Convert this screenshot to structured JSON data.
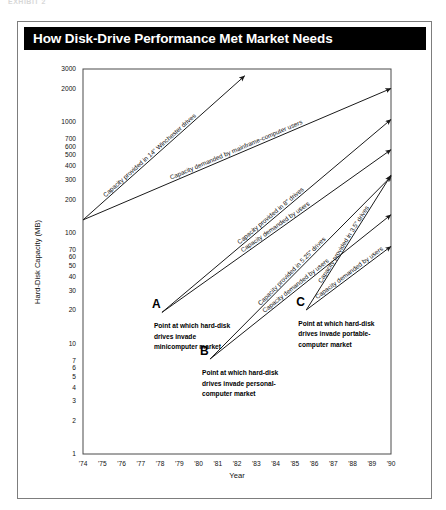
{
  "exhibit": {
    "caption": "EXHIBIT 2"
  },
  "header": {
    "title": "How Disk-Drive Performance Met Market Needs"
  },
  "chart_data": {
    "type": "line",
    "title": "How Disk-Drive Performance Met Market Needs",
    "xlabel": "Year",
    "ylabel": "Hard-Disk Capacity (MB)",
    "yscale": "log",
    "ylim": [
      1,
      3000
    ],
    "xlim": [
      1974,
      1990
    ],
    "grid": false,
    "legend": "inline-labels",
    "ytick_labels": [
      "3000",
      "2000",
      "1000",
      "700",
      "600",
      "500",
      "400",
      "300",
      "200",
      "100",
      "70",
      "60",
      "50",
      "40",
      "30",
      "20",
      "10",
      "7",
      "6",
      "5",
      "4",
      "3",
      "2",
      "1"
    ],
    "ytick_values": [
      3000,
      2000,
      1000,
      700,
      600,
      500,
      400,
      300,
      200,
      100,
      70,
      60,
      50,
      40,
      30,
      20,
      10,
      7,
      6,
      5,
      4,
      3,
      2,
      1
    ],
    "xtick_labels": [
      "'74",
      "'75",
      "'76",
      "'77",
      "'78",
      "'79",
      "'80",
      "'81",
      "'82",
      "'83",
      "'84",
      "'85",
      "'86",
      "'87",
      "'88",
      "'89",
      "'90"
    ],
    "xtick_values": [
      1974,
      1975,
      1976,
      1977,
      1978,
      1979,
      1980,
      1981,
      1982,
      1983,
      1984,
      1985,
      1986,
      1987,
      1988,
      1989,
      1990
    ],
    "series": [
      {
        "name": "Capacity provided in 14\" Winchester drives",
        "label": "Capacity provided in 14\" Winchester drives",
        "x": [
          1974,
          1982.4
        ],
        "y": [
          130,
          2600
        ],
        "arrow": true
      },
      {
        "name": "Capacity demanded by mainframe-computer users",
        "label": "Capacity demanded by mainframe-computer users",
        "x": [
          1974,
          1990
        ],
        "y": [
          130,
          2000
        ],
        "arrow": true
      },
      {
        "name": "Capacity provided in 8\" drives",
        "label": "Capacity provided in 8\" drives",
        "x": [
          1978.1,
          1990
        ],
        "y": [
          19,
          1050
        ],
        "arrow": true
      },
      {
        "name": "Capacity demanded by minicomputer users",
        "label": "Capacity demanded by users",
        "x": [
          1978.1,
          1990
        ],
        "y": [
          19,
          560
        ],
        "arrow": true
      },
      {
        "name": "Capacity provided in 5.25\" drives",
        "label": "Capacity provided in 5.25\" drives",
        "x": [
          1980.6,
          1990
        ],
        "y": [
          7.2,
          320
        ],
        "arrow": true
      },
      {
        "name": "Capacity demanded by personal-computer users",
        "label": "Capacity demanded by users",
        "x": [
          1980.6,
          1990
        ],
        "y": [
          7.2,
          145
        ],
        "arrow": true
      },
      {
        "name": "Capacity provided in 3.5\" drives",
        "label": "Capacity provided in 3.5\" drives",
        "x": [
          1985.6,
          1990
        ],
        "y": [
          20,
          330
        ],
        "arrow": true
      },
      {
        "name": "Capacity demanded by portable-computer users",
        "label": "Capacity demanded by users",
        "x": [
          1985.6,
          1990
        ],
        "y": [
          20,
          75
        ],
        "arrow": true
      }
    ],
    "annotations": [
      {
        "marker": "A",
        "x": 1978.1,
        "y": 19,
        "lines": [
          "Point at which hard-disk",
          "drives invade",
          "minicomputer market"
        ]
      },
      {
        "marker": "B",
        "x": 1980.6,
        "y": 7.2,
        "lines": [
          "Point at which hard-disk",
          "drives invade personal-",
          "computer market"
        ]
      },
      {
        "marker": "C",
        "x": 1985.6,
        "y": 20,
        "lines": [
          "Point at which hard-disk",
          "drives invade portable-",
          "computer market"
        ]
      }
    ]
  },
  "colors": {
    "title_bar_bg": "#000000",
    "title_text": "#ffffff",
    "line": "#1a1a1a",
    "frame": "#4a4a4a",
    "background": "#ffffff"
  }
}
